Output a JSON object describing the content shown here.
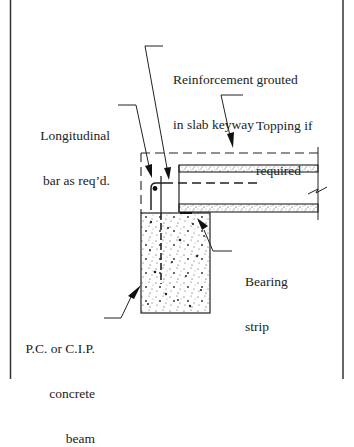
{
  "diagram": {
    "type": "structural-detail",
    "colors": {
      "line": "#222222",
      "background": "#ffffff",
      "stipple": "#333333"
    },
    "labels": {
      "reinforcement": {
        "line1": "Reinforcement grouted",
        "line2": "in slab keyway"
      },
      "topping": {
        "line1": "Topping if",
        "line2": "required"
      },
      "longitudinal": {
        "line1": "Longitudinal",
        "line2": "bar as req’d."
      },
      "bearing": {
        "line1": "Bearing",
        "line2": "strip"
      },
      "beam": {
        "line1": "P.C. or C.I.P.",
        "line2": "concrete",
        "line3": "beam"
      }
    },
    "components": [
      "frame-border",
      "concrete-beam",
      "hollow-core-slab",
      "topping-outline-dashed",
      "longitudinal-bar",
      "grouted-keyway-bar",
      "bearing-strip",
      "break-symbol"
    ]
  }
}
